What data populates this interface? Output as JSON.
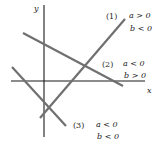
{
  "diagram": {
    "axes": {
      "x_label": "x",
      "y_label": "y",
      "axis_color": "#1a1a1a"
    },
    "line_color": "#707070",
    "lines": [
      {
        "id": "1",
        "tag": "(1)",
        "cond_a": "a > 0",
        "cond_b": "b < 0",
        "from": [
          40,
          118
        ],
        "to": [
          125,
          19
        ]
      },
      {
        "id": "2",
        "tag": "(2)",
        "cond_a": "a < 0",
        "cond_b": "b > 0",
        "from": [
          23,
          33
        ],
        "to": [
          123,
          86
        ]
      },
      {
        "id": "3",
        "tag": "(3)",
        "cond_a": "a < 0",
        "cond_b": "b < 0",
        "from": [
          12,
          67
        ],
        "to": [
          66,
          126
        ]
      }
    ]
  }
}
